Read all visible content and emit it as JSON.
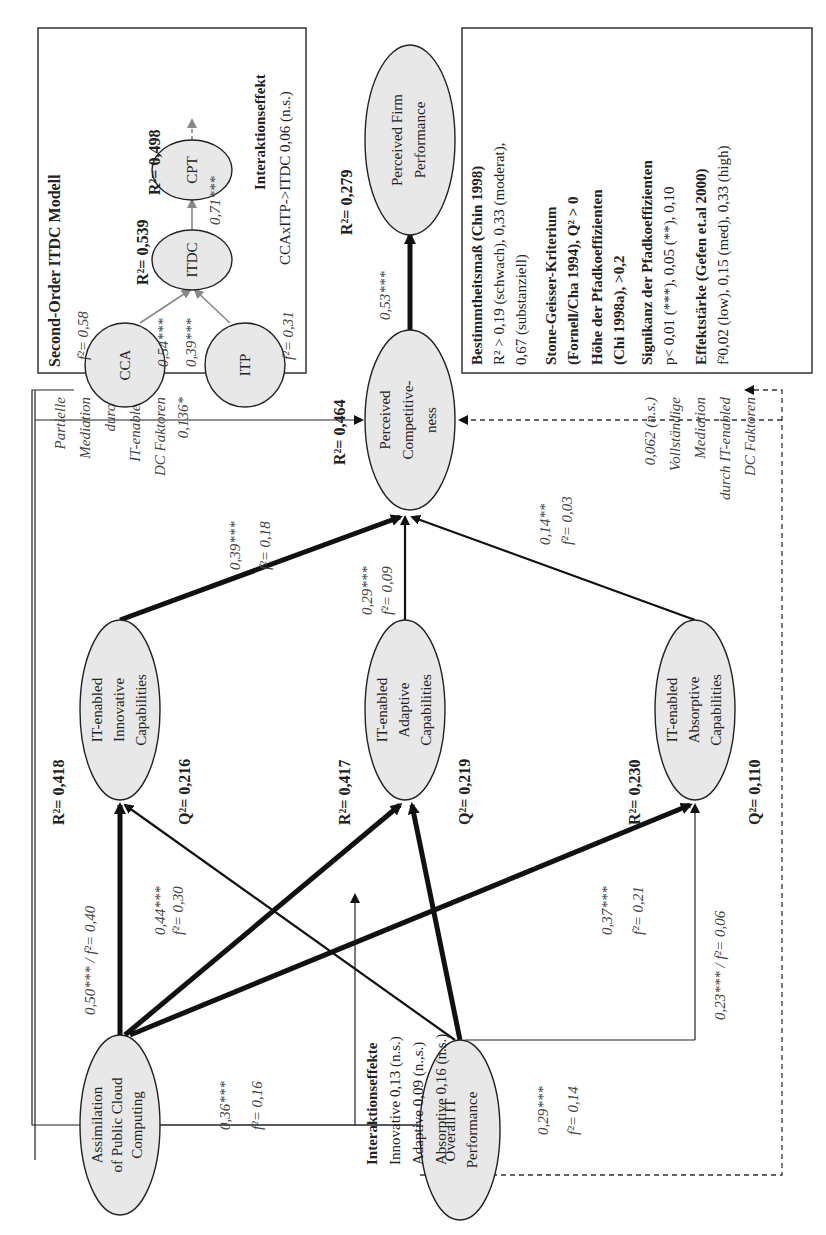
{
  "nodes": {
    "assimilation": [
      "Assimilation",
      "of Public Cloud",
      "Computing"
    ],
    "overall_it": [
      "Overall IT",
      "Performance"
    ],
    "innovative": [
      "IT-enabled",
      "Innovative",
      "Capabilities"
    ],
    "adaptive": [
      "IT-enabled",
      "Adaptive",
      "Capabilities"
    ],
    "absorptive": [
      "IT-enabled",
      "Absorptive",
      "Capabilities"
    ],
    "competitiveness": [
      "Perceived",
      "Competitive-",
      "ness"
    ],
    "firm_performance": [
      "Perceived Firm",
      "Performance"
    ]
  },
  "stats": {
    "innovative_r2": "R²= 0,418",
    "innovative_q2": "Q²= 0,216",
    "adaptive_r2": "R²= 0,417",
    "adaptive_q2": "Q²= 0,219",
    "absorptive_r2": "R²= 0,230",
    "absorptive_q2": "Q²= 0,110",
    "competitiveness_r2": "R²= 0,464",
    "firm_r2": "R²= 0,279"
  },
  "paths": {
    "acc_innov": "0,50*** / f²= 0,40",
    "acc_adapt": [
      "0,44***",
      "f²= 0,30"
    ],
    "acc_absorp": [
      "0,36***",
      "f²= 0,16"
    ],
    "it_innov": [
      "0,29***",
      "f²= 0,14"
    ],
    "it_adapt": [
      "0,37***",
      "f²= 0,21"
    ],
    "it_absorp": "0,23*** / f²= 0,06",
    "innov_comp": [
      "0,39***",
      "f²= 0,18"
    ],
    "adapt_comp": [
      "0,29***",
      "f²= 0,09"
    ],
    "absorp_comp": [
      "0,14**",
      "f²= 0,03"
    ],
    "comp_firm": "0,53***"
  },
  "mediation": {
    "partial": [
      "Partielle",
      "Mediation",
      "durch",
      "IT-enabled",
      "DC Faktoren",
      "0,136*"
    ],
    "full": [
      "0,062 (n.s.)",
      "Vollständige",
      "Mediation",
      "durch IT-enabled",
      "DC Faktoren"
    ]
  },
  "interaction": {
    "title": "Interaktionseffekte",
    "lines": [
      "Innovative 0,13 (n.s.)",
      "Adaptive 0,09 (n.,s.)",
      "Absorptive 0,16 (n.s.)"
    ]
  },
  "second_order": {
    "title": "Second-Order ITDC Modell",
    "cca": "CCA",
    "itp": "ITP",
    "itdc": "ITDC",
    "cpt": "CPT",
    "cca_f2": "f²= 0,58",
    "itp_f2": "f²= 0,31",
    "cca_path": "0,54***",
    "itp_path": "0,39***",
    "itdc_path": "0,71***",
    "itdc_r2": "R²= 0,539",
    "cpt_r2": "R²= 0,498",
    "interaction_title": "Interaktionseffekt",
    "interaction_value": "CCAxITP->ITDC 0,06 (n.s.)"
  },
  "legend": {
    "items": [
      {
        "title": "Bestimmtheitsmaß (Chin 1998)",
        "lines": [
          "R² > 0,19 (schwach), 0,33 (moderat),",
          "0,67 (substanziell)"
        ]
      },
      {
        "title": "Stone-Geisser-Kriterium",
        "lines": [
          "(Fornell/Cha 1994), Q² > 0"
        ]
      },
      {
        "title": "Höhe der Pfadkoeffizienten",
        "lines": [
          "(Chi 1998a), >0,2"
        ]
      },
      {
        "title": "Signikanz der Pfadkoeffizienten",
        "lines": [
          "p< 0,01 (***), 0,05 (**), 0,10"
        ]
      },
      {
        "title": "Effektstärke (Gefen et.al 2000)",
        "lines": [
          "f²0,02 (low), 0,15 (med), 0,33 (high)"
        ]
      }
    ]
  }
}
